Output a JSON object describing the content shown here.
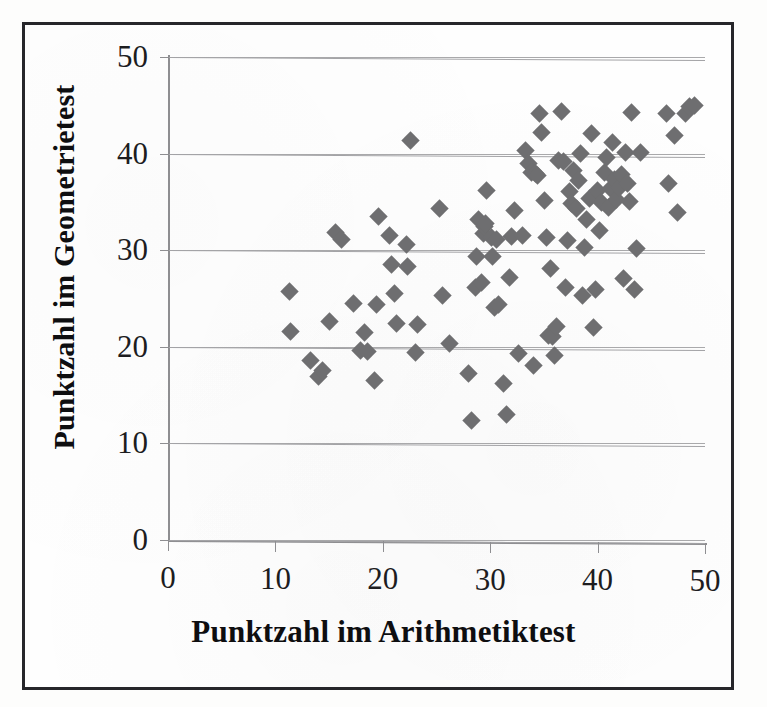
{
  "figure": {
    "kind": "scanned-scatter-plot",
    "marker_color": "#6e6e70",
    "gridline_color": "#a3a3a6",
    "axis_color": "#8e8e91",
    "frame_color": "#26262a",
    "background_color": "#fefefe"
  },
  "chart_data": {
    "type": "scatter",
    "title": "",
    "xlabel": "Punktzahl im Arithmetiktest",
    "ylabel": "Punktzahl im Geometrietest",
    "xlim": [
      0,
      50
    ],
    "ylim": [
      0,
      50
    ],
    "xticks": [
      0,
      10,
      20,
      30,
      40,
      50
    ],
    "yticks": [
      0,
      10,
      20,
      30,
      40,
      50
    ],
    "xtick_labels": [
      "0",
      "10",
      "20",
      "30",
      "40",
      "50"
    ],
    "ytick_labels": [
      "0",
      "10",
      "20",
      "30",
      "40",
      "50"
    ],
    "grid": "horizontal",
    "legend": null,
    "marker": "diamond",
    "series": [
      {
        "name": "Schüler",
        "points": [
          [
            11.3,
            25.8
          ],
          [
            11.4,
            21.7
          ],
          [
            13.3,
            18.7
          ],
          [
            14.0,
            17.0
          ],
          [
            14.4,
            17.6
          ],
          [
            15.0,
            22.7
          ],
          [
            15.6,
            31.9
          ],
          [
            16.2,
            31.2
          ],
          [
            17.3,
            24.6
          ],
          [
            17.9,
            19.7
          ],
          [
            18.3,
            21.6
          ],
          [
            18.6,
            19.6
          ],
          [
            19.2,
            16.6
          ],
          [
            19.4,
            24.5
          ],
          [
            19.6,
            33.6
          ],
          [
            20.6,
            31.7
          ],
          [
            20.8,
            28.6
          ],
          [
            21.1,
            25.6
          ],
          [
            21.3,
            22.5
          ],
          [
            22.2,
            30.7
          ],
          [
            22.3,
            28.5
          ],
          [
            22.6,
            41.5
          ],
          [
            23.0,
            19.6
          ],
          [
            23.2,
            22.5
          ],
          [
            25.3,
            34.5
          ],
          [
            25.6,
            25.5
          ],
          [
            26.2,
            20.5
          ],
          [
            28.0,
            17.4
          ],
          [
            28.3,
            12.5
          ],
          [
            28.6,
            26.3
          ],
          [
            28.7,
            29.5
          ],
          [
            28.9,
            33.4
          ],
          [
            29.2,
            26.8
          ],
          [
            29.4,
            31.9
          ],
          [
            29.5,
            32.6
          ],
          [
            29.6,
            33.0
          ],
          [
            29.7,
            36.4
          ],
          [
            30.1,
            31.5
          ],
          [
            30.2,
            29.5
          ],
          [
            30.4,
            24.3
          ],
          [
            30.6,
            31.3
          ],
          [
            30.8,
            24.6
          ],
          [
            31.2,
            16.4
          ],
          [
            31.5,
            13.2
          ],
          [
            31.8,
            27.4
          ],
          [
            32.0,
            31.6
          ],
          [
            32.3,
            34.3
          ],
          [
            32.6,
            19.5
          ],
          [
            33.0,
            31.7
          ],
          [
            33.3,
            40.5
          ],
          [
            33.6,
            39.2
          ],
          [
            33.8,
            38.3
          ],
          [
            34.0,
            18.3
          ],
          [
            34.2,
            38.2
          ],
          [
            34.4,
            37.9
          ],
          [
            34.6,
            44.4
          ],
          [
            34.8,
            42.4
          ],
          [
            35.1,
            35.4
          ],
          [
            35.2,
            31.5
          ],
          [
            35.4,
            21.4
          ],
          [
            35.6,
            28.3
          ],
          [
            35.8,
            21.3
          ],
          [
            36.0,
            19.3
          ],
          [
            36.2,
            22.3
          ],
          [
            36.4,
            39.5
          ],
          [
            36.6,
            44.6
          ],
          [
            36.8,
            39.4
          ],
          [
            37.0,
            26.4
          ],
          [
            37.2,
            31.2
          ],
          [
            37.4,
            36.3
          ],
          [
            37.6,
            35.1
          ],
          [
            37.8,
            38.5
          ],
          [
            38.0,
            34.6
          ],
          [
            38.2,
            37.5
          ],
          [
            38.4,
            40.3
          ],
          [
            38.6,
            25.6
          ],
          [
            38.8,
            30.5
          ],
          [
            39.0,
            33.4
          ],
          [
            39.2,
            35.6
          ],
          [
            39.4,
            42.3
          ],
          [
            39.6,
            22.2
          ],
          [
            39.8,
            26.2
          ],
          [
            40.0,
            36.4
          ],
          [
            40.2,
            32.3
          ],
          [
            40.4,
            35.2
          ],
          [
            40.6,
            38.3
          ],
          [
            40.8,
            39.9
          ],
          [
            41.0,
            34.7
          ],
          [
            41.2,
            36.6
          ],
          [
            41.4,
            41.4
          ],
          [
            41.6,
            37.6
          ],
          [
            41.8,
            35.5
          ],
          [
            42.0,
            36.8
          ],
          [
            42.2,
            38.1
          ],
          [
            42.4,
            27.3
          ],
          [
            42.6,
            40.4
          ],
          [
            42.8,
            37.2
          ],
          [
            43.0,
            35.3
          ],
          [
            43.2,
            44.5
          ],
          [
            43.4,
            26.2
          ],
          [
            43.6,
            30.4
          ],
          [
            44.0,
            40.4
          ],
          [
            46.4,
            44.4
          ],
          [
            46.6,
            37.2
          ],
          [
            47.2,
            42.2
          ],
          [
            47.4,
            34.2
          ],
          [
            48.2,
            44.4
          ],
          [
            48.6,
            45.2
          ],
          [
            49.0,
            45.3
          ]
        ]
      }
    ]
  }
}
